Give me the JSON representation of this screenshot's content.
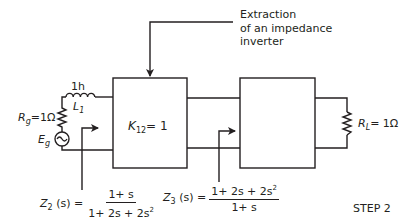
{
  "annotation": {
    "lines": [
      "Extraction",
      "of an impedance",
      "inverter"
    ]
  },
  "source": {
    "rg_symbol": "R",
    "rg_sub": "g",
    "rg_value": "=1Ω",
    "eg_symbol": "E",
    "eg_sub": "g"
  },
  "inductor": {
    "value": "1h",
    "symbol": "L",
    "sub": "1"
  },
  "inverter_block": {
    "symbol": "K",
    "sub": "12",
    "value": "= 1"
  },
  "load": {
    "symbol": "R",
    "sub": "L",
    "value": "= 1Ω"
  },
  "z2": {
    "symbol": "Z",
    "sub": "2",
    "arg": "(s) =",
    "numerator": "1+ s",
    "denominator_base": "1+ 2s + 2s",
    "denominator_exp": "2"
  },
  "z3": {
    "symbol": "Z",
    "sub": "3",
    "arg": "(s) =",
    "numerator_base": "1+ 2s + 2s",
    "numerator_exp": "2",
    "denominator": "1+ s"
  },
  "step_label": "STEP 2",
  "colors": {
    "line": "#231f20",
    "background": "#ffffff"
  }
}
